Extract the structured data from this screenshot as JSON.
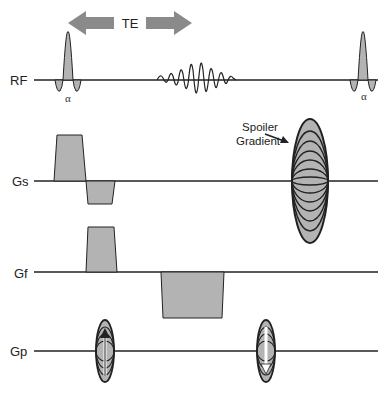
{
  "diagram": {
    "type": "pulse-sequence",
    "te_label": "TE",
    "rows": [
      {
        "id": "rf",
        "label": "RF"
      },
      {
        "id": "gs",
        "label": "Gs"
      },
      {
        "id": "gf",
        "label": "Gf"
      },
      {
        "id": "gp",
        "label": "Gp"
      }
    ],
    "flip_angle_label": "α",
    "spoiler_label_line1": "Spoiler",
    "spoiler_label_line2": "Gradient",
    "colors": {
      "fill": "#b3b3b3",
      "arrow": "#8a8a8a",
      "line": "#222222"
    }
  }
}
